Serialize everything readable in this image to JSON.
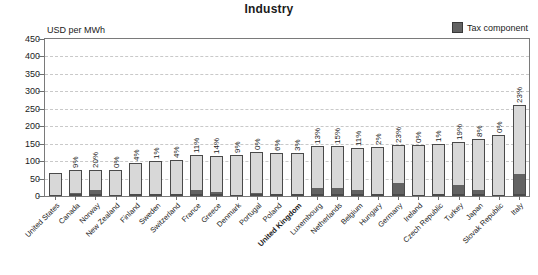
{
  "title": "Industry",
  "axis_unit": "USD per MWh",
  "legend": {
    "label": "Tax component",
    "swatch_color": "#636363"
  },
  "colors": {
    "bar_base": "#d8d8d8",
    "bar_tax": "#636363",
    "bar_outline": "#4a4a4a",
    "gridline": "#c9c9c9",
    "frame": "#7a7a7a",
    "text": "#1b1b1b"
  },
  "highlight_country": "United Kingdom",
  "chart_data": {
    "type": "bar",
    "title": "Industry",
    "xlabel": "",
    "ylabel": "USD per MWh",
    "ylim": [
      0,
      450
    ],
    "yticks": [
      0,
      50,
      100,
      150,
      200,
      250,
      300,
      350,
      400,
      450
    ],
    "grid": true,
    "legend_position": "top-right",
    "stacked": true,
    "categories": [
      "United States",
      "Canada",
      "Norway",
      "New Zealand",
      "Finland",
      "Sweden",
      "Switzerland",
      "France",
      "Greece",
      "Denmark",
      "Portugal",
      "Poland",
      "United Kingdom",
      "Luxembourg",
      "Netherlands",
      "Belgium",
      "Hungary",
      "Germany",
      "Ireland",
      "Czech Republic",
      "Turkey",
      "Japan",
      "Slovak Republic",
      "Italy"
    ],
    "series": [
      {
        "name": "Price excluding tax",
        "values": [
          66,
          68,
          60,
          74,
          92,
          98,
          99,
          104,
          105,
          118,
          120,
          119,
          120,
          125,
          122,
          123,
          137,
          112,
          145,
          148,
          126,
          151,
          176,
          202
        ]
      },
      {
        "name": "Tax component",
        "values": [
          0,
          6,
          15,
          0,
          4,
          1,
          4,
          13,
          9,
          0,
          7,
          4,
          4,
          19,
          21,
          15,
          3,
          34,
          0,
          1,
          30,
          13,
          0,
          60
        ]
      }
    ],
    "totals": [
      66,
      74,
      75,
      74,
      96,
      99,
      103,
      117,
      114,
      118,
      127,
      123,
      124,
      144,
      143,
      138,
      140,
      146,
      145,
      149,
      156,
      164,
      176,
      262
    ],
    "tax_share_labels": [
      "",
      "9%",
      "20%",
      "0%",
      "4%",
      "1%",
      "4%",
      "11%",
      "14%",
      "9%",
      "0%",
      "6%",
      "3%",
      "13%",
      "15%",
      "11%",
      "2%",
      "23%",
      "0%",
      "1%",
      "19%",
      "8%",
      "0%",
      "23%"
    ]
  }
}
